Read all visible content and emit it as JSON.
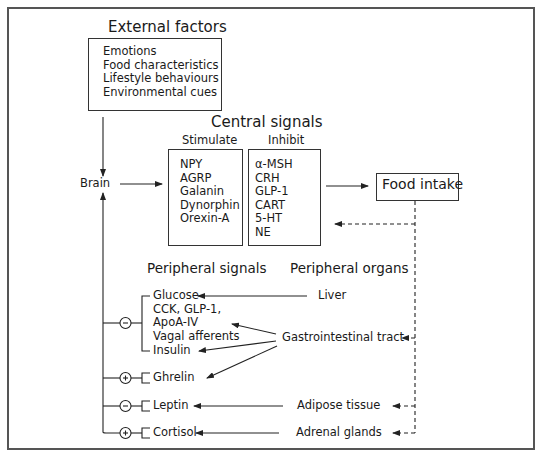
{
  "external_factors": {
    "title": "External factors",
    "items": [
      "Emotions",
      "Food characteristics",
      "Lifestyle behaviours",
      "Environmental cues"
    ]
  },
  "brain": {
    "label": "Brain"
  },
  "central_signals": {
    "title": "Central signals",
    "stimulate": {
      "label": "Stimulate",
      "items": [
        "NPY",
        "AGRP",
        "Galanin",
        "Dynorphin",
        "Orexin-A"
      ]
    },
    "inhibit": {
      "label": "Inhibit",
      "items": [
        "α-MSH",
        "CRH",
        "GLP-1",
        "CART",
        "5-HT",
        "NE"
      ]
    }
  },
  "food_intake": {
    "label": "Food intake"
  },
  "peripheral_signals": {
    "title": "Peripheral signals",
    "groups": [
      {
        "effect": "-",
        "items": [
          "Glucose",
          "CCK, GLP-1,",
          "ApoA-IV",
          "Vagal afferents",
          "Insulin"
        ]
      },
      {
        "effect": "+",
        "items": [
          "Ghrelin"
        ]
      },
      {
        "effect": "-",
        "items": [
          "Leptin"
        ]
      },
      {
        "effect": "+",
        "items": [
          "Cortisol"
        ]
      }
    ]
  },
  "peripheral_organs": {
    "title": "Peripheral organs",
    "items": [
      "Liver",
      "Gastrointestinal tract",
      "Adipose tissue",
      "Adrenal glands"
    ]
  }
}
